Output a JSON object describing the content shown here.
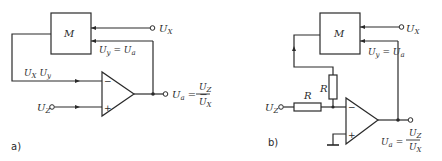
{
  "diagrams": [
    {
      "caption": "a)",
      "multiplier_label": "M",
      "input_x": {
        "main": "U",
        "sub": "X"
      },
      "input_y_label": {
        "main": "U",
        "sub": "y",
        "eq": " = ",
        "main2": "U",
        "sub2": "a"
      },
      "product_label": {
        "m1": "U",
        "s1": "X",
        "m2": " U",
        "s2": "y"
      },
      "input_z": {
        "main": "U",
        "sub": "Z"
      },
      "opamp_inverting": "−",
      "opamp_noninverting": "+",
      "output": {
        "main": "U",
        "sub": "a",
        "eq": " = −",
        "num_main": "U",
        "num_sub": "Z",
        "den_main": "U",
        "den_sub": "X"
      }
    },
    {
      "caption": "b)",
      "multiplier_label": "M",
      "input_x": {
        "main": "U",
        "sub": "X"
      },
      "input_y_label": {
        "main": "U",
        "sub": "y",
        "eq": " = ",
        "main2": "U",
        "sub2": "a"
      },
      "resistor_feedback": "R",
      "resistor_input": "R",
      "input_z": {
        "main": "U",
        "sub": "Z"
      },
      "opamp_inverting": "−",
      "opamp_noninverting": "+",
      "output": {
        "main": "U",
        "sub": "a",
        "eq": " = ",
        "num_main": "U",
        "num_sub": "Z",
        "den_main": "U",
        "den_sub": "X"
      }
    }
  ]
}
